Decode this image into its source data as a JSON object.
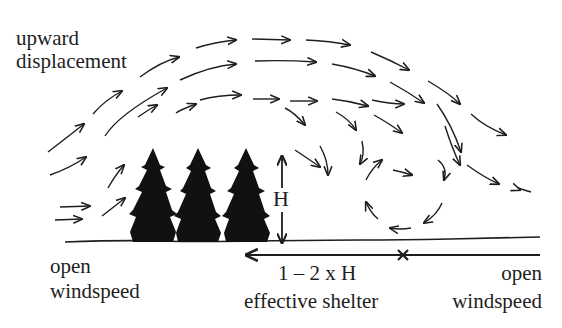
{
  "diagram": {
    "labels": {
      "upward_line1": "upward",
      "upward_line2": "displacement",
      "left_line1": "open",
      "left_line2": "windspeed",
      "height": "H",
      "shelter_line1": "1 – 2 x H",
      "shelter_line2": "effective shelter",
      "right_line1": "open",
      "right_line2": "windspeed"
    },
    "elements": {
      "trees": 3,
      "ground_line": true,
      "height_marker": "double-arrow-vertical",
      "shelter_marker": "left-arrow-with-x",
      "airflow": "curved arrows over trees with eddy circulation downwind"
    },
    "colors": {
      "ink": "#1e1e1e",
      "background": "#ffffff"
    }
  }
}
